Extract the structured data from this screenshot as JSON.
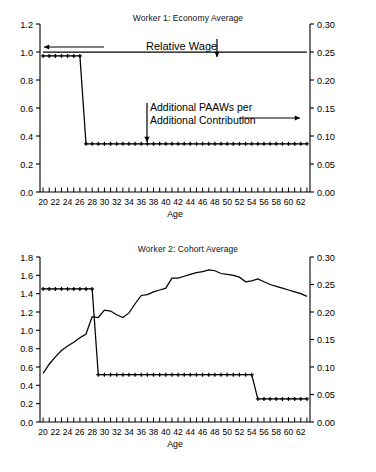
{
  "figure": {
    "background": "#ffffff",
    "line_color": "#000000",
    "axis_color": "#000000"
  },
  "chart_data": [
    {
      "type": "line",
      "title": "Worker 1: Economy Average",
      "xlabel": "Age",
      "ylabel": "",
      "xlim": [
        19.5,
        63.5
      ],
      "ylim": [
        0.0,
        1.2
      ],
      "ylim_right": [
        0.0,
        0.3
      ],
      "grid": false,
      "legend_position": "none",
      "yticks_left": [
        "0.0",
        "0.2",
        "0.4",
        "0.6",
        "0.8",
        "1.0",
        "1.2"
      ],
      "yticks_right": [
        "0.00",
        "0.05",
        "0.10",
        "0.15",
        "0.20",
        "0.25",
        "0.30"
      ],
      "xticks": [
        "20",
        "22",
        "24",
        "26",
        "28",
        "30",
        "32",
        "34",
        "36",
        "38",
        "40",
        "42",
        "44",
        "46",
        "48",
        "50",
        "52",
        "54",
        "56",
        "58",
        "60",
        "62"
      ],
      "x": [
        20,
        21,
        22,
        23,
        24,
        25,
        26,
        27,
        28,
        29,
        30,
        31,
        32,
        33,
        34,
        35,
        36,
        37,
        38,
        39,
        40,
        41,
        42,
        43,
        44,
        45,
        46,
        47,
        48,
        49,
        50,
        51,
        52,
        53,
        54,
        55,
        56,
        57,
        58,
        59,
        60,
        61,
        62,
        63
      ],
      "annotations": [
        {
          "name": "relative-wage-label",
          "text": "Relative Wage"
        },
        {
          "name": "additional-paaws-label-line1",
          "text": "Additional PAAWs per"
        },
        {
          "name": "additional-paaws-label-line2",
          "text": "Additional Contribution"
        }
      ],
      "series": [
        {
          "name": "Relative Wage",
          "axis": "left",
          "marker": "none",
          "values": [
            1.0,
            1.0,
            1.0,
            1.0,
            1.0,
            1.0,
            1.0,
            1.0,
            1.0,
            1.0,
            1.0,
            1.0,
            1.0,
            1.0,
            1.0,
            1.0,
            1.0,
            1.0,
            1.0,
            1.0,
            1.0,
            1.0,
            1.0,
            1.0,
            1.0,
            1.0,
            1.0,
            1.0,
            1.0,
            1.0,
            1.0,
            1.0,
            1.0,
            1.0,
            1.0,
            1.0,
            1.0,
            1.0,
            1.0,
            1.0,
            1.0,
            1.0,
            1.0,
            1.0
          ]
        },
        {
          "name": "Additional PAAWs per Additional Contribution",
          "axis": "right",
          "marker": "plus",
          "values": [
            0.243,
            0.243,
            0.243,
            0.243,
            0.243,
            0.243,
            0.243,
            0.086,
            0.086,
            0.086,
            0.086,
            0.086,
            0.086,
            0.086,
            0.086,
            0.086,
            0.086,
            0.086,
            0.086,
            0.086,
            0.086,
            0.086,
            0.086,
            0.086,
            0.086,
            0.086,
            0.086,
            0.086,
            0.086,
            0.086,
            0.086,
            0.086,
            0.086,
            0.086,
            0.086,
            0.086,
            0.086,
            0.086,
            0.086,
            0.086,
            0.086,
            0.086,
            0.086,
            0.086
          ]
        }
      ]
    },
    {
      "type": "line",
      "title": "Worker 2: Cohort Average",
      "xlabel": "Age",
      "ylabel": "",
      "xlim": [
        19.5,
        63.5
      ],
      "ylim": [
        0.0,
        1.8
      ],
      "ylim_right": [
        0.0,
        0.3
      ],
      "grid": false,
      "legend_position": "none",
      "yticks_left": [
        "0.0",
        "0.2",
        "0.4",
        "0.6",
        "0.8",
        "1.0",
        "1.2",
        "1.4",
        "1.6",
        "1.8"
      ],
      "yticks_right": [
        "0.00",
        "0.05",
        "0.10",
        "0.15",
        "0.20",
        "0.25",
        "0.30"
      ],
      "xticks": [
        "20",
        "22",
        "24",
        "26",
        "28",
        "30",
        "32",
        "34",
        "36",
        "38",
        "40",
        "42",
        "44",
        "46",
        "48",
        "50",
        "52",
        "54",
        "56",
        "58",
        "60",
        "62"
      ],
      "x": [
        20,
        21,
        22,
        23,
        24,
        25,
        26,
        27,
        28,
        29,
        30,
        31,
        32,
        33,
        34,
        35,
        36,
        37,
        38,
        39,
        40,
        41,
        42,
        43,
        44,
        45,
        46,
        47,
        48,
        49,
        50,
        51,
        52,
        53,
        54,
        55,
        56,
        57,
        58,
        59,
        60,
        61,
        62,
        63
      ],
      "series": [
        {
          "name": "Relative Wage",
          "axis": "left",
          "marker": "none",
          "values": [
            0.53,
            0.63,
            0.71,
            0.78,
            0.83,
            0.87,
            0.92,
            0.96,
            1.15,
            1.14,
            1.22,
            1.21,
            1.17,
            1.14,
            1.19,
            1.29,
            1.38,
            1.39,
            1.42,
            1.44,
            1.46,
            1.57,
            1.57,
            1.59,
            1.61,
            1.63,
            1.64,
            1.66,
            1.65,
            1.62,
            1.61,
            1.6,
            1.58,
            1.53,
            1.54,
            1.56,
            1.53,
            1.5,
            1.48,
            1.46,
            1.44,
            1.42,
            1.4,
            1.37
          ]
        },
        {
          "name": "Additional PAAWs per Additional Contribution",
          "axis": "right",
          "marker": "plus",
          "values": [
            0.242,
            0.242,
            0.242,
            0.242,
            0.242,
            0.242,
            0.242,
            0.242,
            0.242,
            0.086,
            0.086,
            0.086,
            0.086,
            0.086,
            0.086,
            0.086,
            0.086,
            0.086,
            0.086,
            0.086,
            0.086,
            0.086,
            0.086,
            0.086,
            0.086,
            0.086,
            0.086,
            0.086,
            0.086,
            0.086,
            0.086,
            0.086,
            0.086,
            0.086,
            0.086,
            0.042,
            0.042,
            0.042,
            0.042,
            0.042,
            0.042,
            0.042,
            0.042,
            0.042
          ]
        }
      ]
    }
  ]
}
